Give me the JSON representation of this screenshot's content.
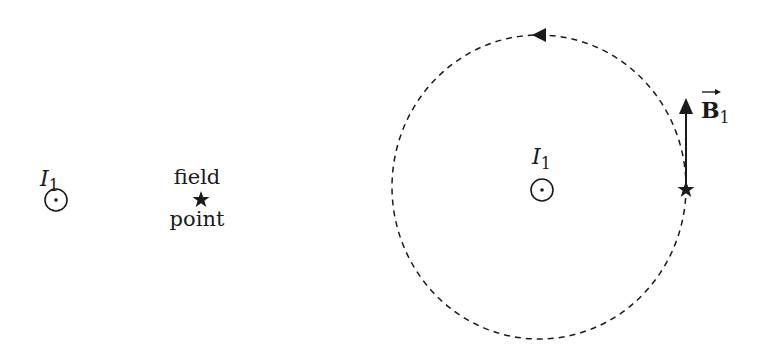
{
  "left_panel": {
    "current_label": "I",
    "current_subscript": "1",
    "field_point_label_top": "field",
    "field_point_label_bottom": "point",
    "current_symbol": "out-of-page-icon",
    "field_point_symbol": "star-icon"
  },
  "right_panel": {
    "current_label": "I",
    "current_subscript": "1",
    "vector_label": "B",
    "vector_subscript": "1",
    "circle_style": "dashed",
    "circulation": "counterclockwise",
    "current_symbol": "out-of-page-icon",
    "field_point_symbol": "star-icon"
  },
  "colors": {
    "ink": "#1a1a1a",
    "background": "#ffffff"
  }
}
